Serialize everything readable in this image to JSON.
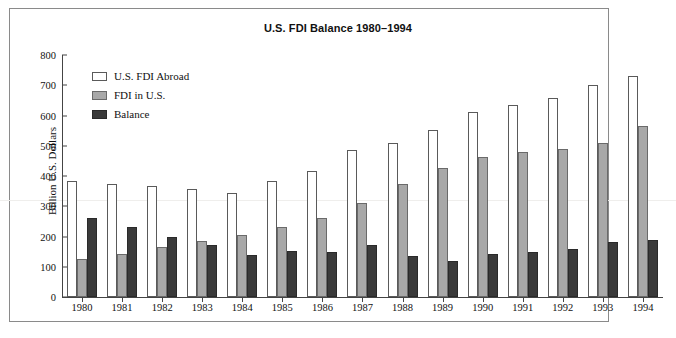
{
  "chart_data": {
    "type": "bar",
    "title": "U.S. FDI Balance 1980–1994",
    "xlabel": "",
    "ylabel": "Billion U.S. Dollars",
    "ylim": [
      0,
      800
    ],
    "ytick_step": 100,
    "yticks": [
      "800",
      "700",
      "600",
      "500",
      "400",
      "300",
      "200",
      "100",
      "0"
    ],
    "grid": false,
    "legend_position": "top-left-inside",
    "categories": [
      "1980",
      "1981",
      "1982",
      "1983",
      "1984",
      "1985",
      "1986",
      "1987",
      "1988",
      "1989",
      "1990",
      "1991",
      "1992",
      "1993",
      "1994"
    ],
    "series": [
      {
        "name": "U.S. FDI Abroad",
        "color": "#ffffff",
        "values": [
          385,
          375,
          368,
          358,
          345,
          385,
          418,
          485,
          508,
          552,
          610,
          635,
          658,
          700,
          730
        ]
      },
      {
        "name": "FDI in U.S.",
        "color": "#a8a8a8",
        "values": [
          125,
          143,
          165,
          185,
          205,
          232,
          262,
          310,
          372,
          427,
          462,
          480,
          490,
          508,
          565
        ]
      },
      {
        "name": "Balance",
        "color": "#3a3a3a",
        "values": [
          260,
          230,
          198,
          173,
          140,
          153,
          150,
          172,
          135,
          118,
          143,
          148,
          160,
          183,
          187
        ]
      }
    ]
  }
}
